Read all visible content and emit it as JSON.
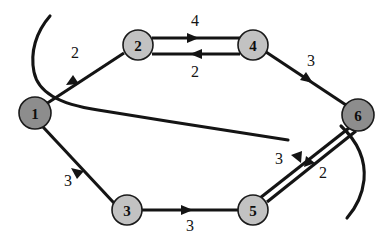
{
  "diagram": {
    "background_color": "#ffffff",
    "stroke_color": "#141414",
    "node_fill_dark": "#8d8d8d",
    "node_fill_light": "#c2c2c2",
    "node_stroke": "#1a1a1a"
  },
  "nodes": [
    {
      "id": "1",
      "label": "1",
      "cx": 35,
      "cy": 113,
      "r": 16,
      "shade": "dark"
    },
    {
      "id": "2",
      "label": "2",
      "cx": 138,
      "cy": 45,
      "r": 15,
      "shade": "light"
    },
    {
      "id": "3",
      "label": "3",
      "cx": 127,
      "cy": 210,
      "r": 15,
      "shade": "light"
    },
    {
      "id": "4",
      "label": "4",
      "cx": 253,
      "cy": 45,
      "r": 15,
      "shade": "light"
    },
    {
      "id": "5",
      "label": "5",
      "cx": 253,
      "cy": 210,
      "r": 15,
      "shade": "light"
    },
    {
      "id": "6",
      "label": "6",
      "cx": 358,
      "cy": 115,
      "r": 16,
      "shade": "dark"
    }
  ],
  "edges": [
    {
      "id": "e1",
      "from": "1",
      "to": "2",
      "weight": "2",
      "label_x": 75,
      "label_y": 52
    },
    {
      "id": "e2",
      "from": "2",
      "to": "4",
      "weight": "4",
      "label_x": 195,
      "label_y": 20
    },
    {
      "id": "e3",
      "from": "4",
      "to": "2",
      "weight": "2",
      "label_x": 195,
      "label_y": 71
    },
    {
      "id": "e4",
      "from": "4",
      "to": "6",
      "weight": "3",
      "label_x": 311,
      "label_y": 60
    },
    {
      "id": "e5",
      "from": "1",
      "to": "3",
      "weight": "3",
      "label_x": 68,
      "label_y": 180
    },
    {
      "id": "e6",
      "from": "3",
      "to": "5",
      "weight": "3",
      "label_x": 190,
      "label_y": 225
    },
    {
      "id": "e7",
      "from": "6",
      "to": "5",
      "weight": "3",
      "label_x": 279,
      "label_y": 158
    },
    {
      "id": "e8",
      "from": "5",
      "to": "6",
      "weight": "2",
      "label_x": 323,
      "label_y": 172
    }
  ],
  "stray_curves": [
    {
      "id": "c1",
      "description": "long curve crossing from upper-left to mid-right"
    },
    {
      "id": "c2",
      "description": "short curve descending from node 6 to lower-right"
    }
  ]
}
